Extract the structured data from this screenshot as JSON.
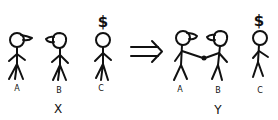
{
  "figure": {
    "left_group": {
      "caption": "X",
      "figures": [
        {
          "label": "A",
          "accessory": "cap-facing-right"
        },
        {
          "label": "B",
          "accessory": "cap-facing-left"
        },
        {
          "label": "C",
          "accessory": "dollar-sign"
        }
      ]
    },
    "arrow": {
      "symbol": "⇒",
      "meaning": "implies"
    },
    "right_group": {
      "caption": "Y",
      "figures": [
        {
          "label": "A",
          "accessory": "cap-facing-right",
          "handshake_with": "B"
        },
        {
          "label": "B",
          "accessory": "cap-facing-left",
          "handshake_with": "A"
        },
        {
          "label": "C",
          "accessory": "dollar-sign"
        }
      ]
    },
    "dollar_symbol": "$"
  }
}
